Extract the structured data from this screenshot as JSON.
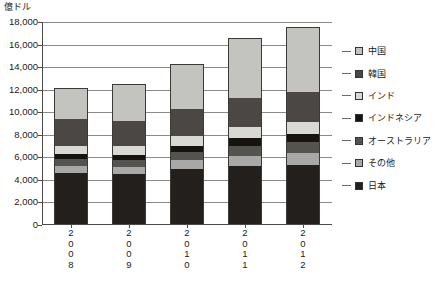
{
  "axis_unit_label": "億ドル",
  "chart_data": {
    "type": "bar",
    "subtype": "stacked-bar",
    "title": "",
    "subtitle": "",
    "xlabel": "",
    "ylabel": "億ドル",
    "ylim": [
      0,
      18000
    ],
    "ytick_step": 2000,
    "grid": true,
    "legend_position": "right",
    "categories": [
      "2008",
      "2009",
      "2010",
      "2011",
      "2012"
    ],
    "ytick_labels": [
      "18,000",
      "16,000",
      "14,000",
      "12,000",
      "10,000",
      "8,000",
      "6,000",
      "4,000",
      "2,000",
      "0"
    ],
    "series": [
      {
        "name": "日本",
        "color": "#231f1c",
        "values": [
          4650,
          4550,
          5000,
          5250,
          5350
        ]
      },
      {
        "name": "その他",
        "color": "#a8a8a8",
        "values": [
          600,
          600,
          750,
          900,
          1000
        ]
      },
      {
        "name": "オーストラリア",
        "color": "#555350",
        "values": [
          600,
          650,
          700,
          900,
          1000
        ]
      },
      {
        "name": "インドネシア",
        "color": "#17130f",
        "values": [
          450,
          450,
          550,
          700,
          750
        ]
      },
      {
        "name": "インド",
        "color": "#d8d8d4",
        "values": [
          750,
          800,
          900,
          950,
          1000
        ]
      },
      {
        "name": "韓国",
        "color": "#4a4744",
        "values": [
          2350,
          2150,
          2350,
          2550,
          2700
        ]
      },
      {
        "name": "中国",
        "color": "#c3c3c0",
        "values": [
          2750,
          3300,
          4000,
          5350,
          5800
        ]
      }
    ],
    "totals": [
      12150,
      12500,
      14250,
      16600,
      17600
    ]
  },
  "legend": {
    "items": [
      {
        "label": "中国",
        "color": "#c3c3c0"
      },
      {
        "label": "韓国",
        "color": "#4a4744"
      },
      {
        "label": "インド",
        "color": "#d8d8d4"
      },
      {
        "label": "インドネシア",
        "color": "#17130f"
      },
      {
        "label": "オーストラリア",
        "color": "#555350"
      },
      {
        "label": "その他",
        "color": "#a8a8a8"
      },
      {
        "label": "日本",
        "color": "#231f1c"
      }
    ]
  }
}
